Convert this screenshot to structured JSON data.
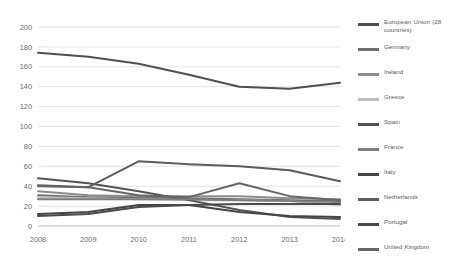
{
  "chart_data": {
    "type": "line",
    "title": "",
    "xlabel": "",
    "ylabel": "",
    "categories": [
      2008,
      2009,
      2010,
      2011,
      2012,
      2013,
      2014
    ],
    "x_tick_labels": [
      "2008",
      "2009",
      "2010",
      "2011",
      "2012",
      "2013",
      "2014"
    ],
    "y_tick_labels": [
      "0",
      "20",
      "40",
      "60",
      "80",
      "100",
      "120",
      "140",
      "160",
      "180",
      "200"
    ],
    "ylim": [
      0,
      200
    ],
    "y_step": 20,
    "grid": true,
    "legend_position": "right",
    "series": [
      {
        "name": "European Union (28 countries)",
        "color": "#4f4f4f",
        "values": [
          174,
          170,
          163,
          152,
          140,
          138,
          144
        ]
      },
      {
        "name": "Germany",
        "color": "#6e6e6e",
        "values": [
          31,
          29,
          29,
          28,
          27,
          26,
          25
        ]
      },
      {
        "name": "Ireland",
        "color": "#8c8c8c",
        "values": [
          35,
          31,
          30,
          30,
          30,
          28,
          27
        ]
      },
      {
        "name": "Greece",
        "color": "#bdbdbd",
        "values": [
          29,
          28,
          27,
          26,
          26,
          25,
          21
        ]
      },
      {
        "name": "Spain",
        "color": "#535353",
        "values": [
          48,
          43,
          35,
          26,
          16,
          9,
          7
        ]
      },
      {
        "name": "France",
        "color": "#7d7d7d",
        "values": [
          27,
          27,
          27,
          27,
          26,
          25,
          24
        ]
      },
      {
        "name": "Italy",
        "color": "#454545",
        "values": [
          12,
          14,
          21,
          21,
          14,
          10,
          9
        ]
      },
      {
        "name": "Netherlands",
        "color": "#5c5c5c",
        "values": [
          41,
          39,
          65,
          62,
          60,
          56,
          45
        ]
      },
      {
        "name": "Portugal",
        "color": "#4a4a4a",
        "values": [
          10,
          12,
          19,
          21,
          22,
          22,
          22
        ]
      },
      {
        "name": "United Kingdom",
        "color": "#666666",
        "values": [
          40,
          39,
          31,
          29,
          43,
          30,
          26
        ]
      }
    ]
  }
}
